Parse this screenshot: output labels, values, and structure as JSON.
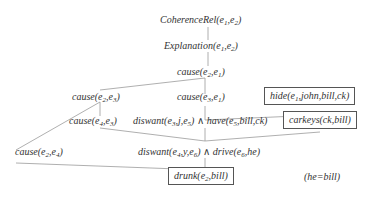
{
  "diagram": {
    "nodes": [
      {
        "id": "coherence",
        "pred": "CoherenceRel",
        "args": [
          "e",
          "1",
          "e",
          "2"
        ],
        "text": "CoherenceRel(e1,e2)"
      },
      {
        "id": "explanation",
        "pred": "Explanation",
        "text": "Explanation(e1,e2)"
      },
      {
        "id": "cause_e2_e1",
        "pred": "cause",
        "text": "cause(e2,e1)"
      },
      {
        "id": "cause_e2_e3",
        "pred": "cause",
        "text": "cause(e2,e3)"
      },
      {
        "id": "cause_e3_e1",
        "pred": "cause",
        "text": "cause(e3,e1)"
      },
      {
        "id": "hide",
        "pred": "hide",
        "text": "hide(e1,john,bill,ck)",
        "boxed": true
      },
      {
        "id": "cause_e4_e3",
        "pred": "cause",
        "text": "cause(e4,e3)"
      },
      {
        "id": "diswant_have",
        "pred": "diswant",
        "text": "diswant(e3,j,e5) ∧ have(e5,bill,ck)"
      },
      {
        "id": "carkeys",
        "pred": "carkeys",
        "text": "carkeys(ck,bill)",
        "boxed": true
      },
      {
        "id": "cause_e2_e4",
        "pred": "cause",
        "text": "cause(e2,e4)"
      },
      {
        "id": "diswant_drive",
        "pred": "diswant",
        "text": "diswant(e4,y,e6) ∧ drive(e6,he)"
      },
      {
        "id": "drunk",
        "pred": "drunk",
        "text": "drunk(e2,bill)",
        "boxed": true
      },
      {
        "id": "he_bill",
        "pred": "",
        "text": "(he=bill)"
      }
    ],
    "colors": {
      "line": "#9a9a9a",
      "text": "#333333",
      "box_border": "#555555"
    }
  }
}
